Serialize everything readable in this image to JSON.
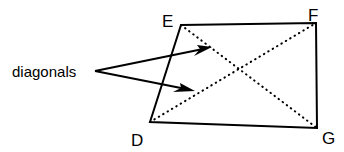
{
  "figure": {
    "background_color": "#ffffff",
    "stroke_color": "#000000",
    "width": 344,
    "height": 152,
    "callout": {
      "text": "diagonals",
      "anchor_x": 95,
      "anchor_y": 71,
      "text_x": 12,
      "text_y": 77
    },
    "vertices": [
      {
        "id": "E",
        "label": "E",
        "x": 181,
        "y": 25,
        "label_x": 162,
        "label_y": 27
      },
      {
        "id": "F",
        "label": "F",
        "x": 316,
        "y": 23,
        "label_x": 308,
        "label_y": 21
      },
      {
        "id": "G",
        "label": "G",
        "x": 317,
        "y": 128,
        "label_x": 322,
        "label_y": 144
      },
      {
        "id": "D",
        "label": "D",
        "x": 150,
        "y": 122,
        "label_x": 131,
        "label_y": 146
      }
    ],
    "edges": [
      {
        "name": "edge-EF",
        "from": "E",
        "to": "F",
        "style": "solid"
      },
      {
        "name": "edge-FG",
        "from": "F",
        "to": "G",
        "style": "solid"
      },
      {
        "name": "edge-GD",
        "from": "G",
        "to": "D",
        "style": "solid"
      },
      {
        "name": "edge-DE",
        "from": "D",
        "to": "E",
        "style": "solid"
      }
    ],
    "diagonals": [
      {
        "name": "diagonal-EG",
        "from": "E",
        "to": "G",
        "style": "dotted"
      },
      {
        "name": "diagonal-DF",
        "from": "D",
        "to": "F",
        "style": "dotted"
      }
    ],
    "arrows": [
      {
        "name": "arrow-to-diagonal-DF",
        "x1": 95,
        "y1": 71,
        "x2": 211,
        "y2": 47
      },
      {
        "name": "arrow-to-diagonal-EG",
        "x1": 95,
        "y1": 71,
        "x2": 194,
        "y2": 91
      }
    ],
    "polygon_points": "181,25 316,23 317,128 150,122"
  }
}
